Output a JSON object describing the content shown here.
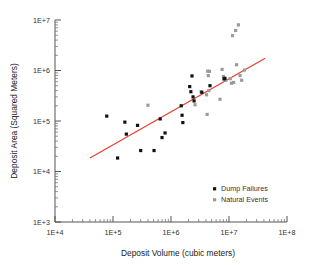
{
  "chart_data": {
    "type": "scatter",
    "title": "",
    "xlabel": "Deposit Volume (cubic meters)",
    "ylabel": "Deposit Area (Squared Meters)",
    "xscale": "log",
    "yscale": "log",
    "xlim": [
      10000,
      100000000
    ],
    "ylim": [
      1000,
      10000000
    ],
    "xticklabels": [
      "1E+4",
      "1E+5",
      "1E+6",
      "1E+7",
      "1E+8"
    ],
    "xtickvalues": [
      10000,
      100000,
      1000000,
      10000000,
      100000000
    ],
    "yticklabels": [
      "1E+3",
      "1E+4",
      "1E+5",
      "1E+6",
      "1E+7"
    ],
    "ytickvalues": [
      1000,
      10000,
      100000,
      1000000,
      10000000
    ],
    "grid": false,
    "minor_ticks": true,
    "legend_position": "lower-right",
    "series": [
      {
        "name": "Dump Failures",
        "marker": "square",
        "color": "#111111",
        "points": [
          [
            78000,
            125000
          ],
          [
            120000,
            18500
          ],
          [
            160000,
            95000
          ],
          [
            170000,
            55000
          ],
          [
            265000,
            82000
          ],
          [
            300000,
            26000
          ],
          [
            510000,
            26000
          ],
          [
            650000,
            110000
          ],
          [
            700000,
            47000
          ],
          [
            790000,
            58000
          ],
          [
            1500000,
            200000
          ],
          [
            1550000,
            130000
          ],
          [
            1600000,
            93000
          ],
          [
            2100000,
            480000
          ],
          [
            2200000,
            380000
          ],
          [
            2300000,
            780000
          ],
          [
            2400000,
            300000
          ],
          [
            2500000,
            250000
          ],
          [
            3400000,
            370000
          ],
          [
            4700000,
            500000
          ],
          [
            8200000,
            680000
          ],
          [
            8500000,
            700000
          ]
        ]
      },
      {
        "name": "Natural Events",
        "marker": "square",
        "color": "#9b9b9b",
        "points": [
          [
            400000,
            205000
          ],
          [
            2600000,
            210000
          ],
          [
            3300000,
            380000
          ],
          [
            4300000,
            970000
          ],
          [
            4600000,
            960000
          ],
          [
            4400000,
            790000
          ],
          [
            4500000,
            400000
          ],
          [
            4200000,
            135000
          ],
          [
            4100000,
            330000
          ],
          [
            7000000,
            270000
          ],
          [
            7600000,
            1050000
          ],
          [
            8000000,
            760000
          ],
          [
            8800000,
            640000
          ],
          [
            10500000,
            690000
          ],
          [
            11000000,
            560000
          ],
          [
            12000000,
            580000
          ],
          [
            13500000,
            1300000
          ],
          [
            15500000,
            790000
          ],
          [
            16500000,
            640000
          ],
          [
            18500000,
            1020000
          ],
          [
            11500000,
            4900000
          ],
          [
            13000000,
            6200000
          ],
          [
            14500000,
            8000000
          ]
        ]
      }
    ],
    "trendline": {
      "color": "#e8392a",
      "x_start": 40000,
      "y_start": 18500,
      "x_end": 42000000,
      "y_end": 1750000
    },
    "legend_entries": [
      {
        "label": "Dump Failures",
        "color": "#111111"
      },
      {
        "label": "Natural Events",
        "color": "#9b9b9b"
      }
    ]
  }
}
